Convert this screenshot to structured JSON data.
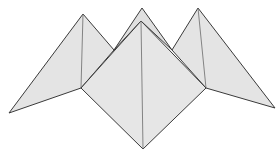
{
  "diagram": {
    "type": "origami-fortune-teller",
    "colors": {
      "fill": "#e4e4e4",
      "fill_dark": "#dcdcdc",
      "stroke": "#3a3a3a",
      "crease": "#6a6a6a",
      "background": "#ffffff"
    },
    "vertices": {
      "back_top": [
        142,
        8
      ],
      "front_top": [
        141,
        21
      ],
      "bottom": [
        143,
        149
      ],
      "left_tip": [
        9,
        113
      ],
      "left_top": [
        83,
        14
      ],
      "left_inner": [
        81,
        88
      ],
      "right_tip": [
        275,
        108
      ],
      "right_top": [
        198,
        8
      ],
      "right_inner": [
        206,
        88
      ]
    }
  }
}
